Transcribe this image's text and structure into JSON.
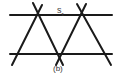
{
  "figure": {
    "label_main": "s",
    "label_sub": "τ",
    "caption": "(b)",
    "line_color": "#1a1a1a",
    "lines": [
      {
        "x1": 10,
        "y1": 15,
        "x2": 112,
        "y2": 15
      },
      {
        "x1": 10,
        "y1": 54,
        "x2": 112,
        "y2": 54
      },
      {
        "x1": 33,
        "y1": 3,
        "x2": 63,
        "y2": 65
      },
      {
        "x1": 42,
        "y1": 5,
        "x2": 12,
        "y2": 65
      },
      {
        "x1": 86,
        "y1": 4,
        "x2": 56,
        "y2": 65
      },
      {
        "x1": 77,
        "y1": 4,
        "x2": 111,
        "y2": 65
      }
    ]
  }
}
